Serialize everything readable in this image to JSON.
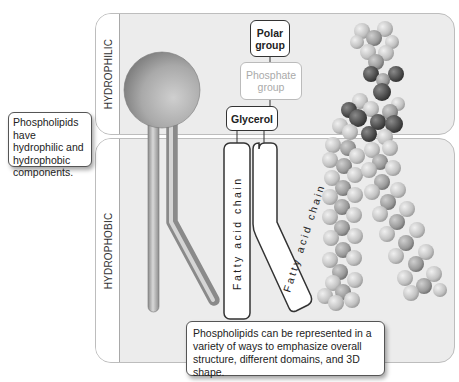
{
  "regions": {
    "hydrophilic_label": "HYDROPHILIC",
    "hydrophobic_label": "HYDROPHOBIC"
  },
  "callouts": {
    "left": "Phospholipids have hydrophilic and hydrophobic components.",
    "bottom": "Phospholipids can be represented in a variety of ways to emphasize overall structure, different domains, and 3D shape."
  },
  "schematic": {
    "polar_group": "Polar group",
    "phosphate_group": "Phosphate group",
    "glycerol": "Glycerol",
    "fatty_acid_chain_1": "Fatty acid chain",
    "fatty_acid_chain_2": "Fatty acid chain"
  },
  "models": {
    "ball_and_stick": "simplified-phospholipid-model",
    "space_filling": "space-filling-3d-model"
  },
  "colors": {
    "panel_bg": "#ececec",
    "panel_border": "#bdbdbd",
    "phosphate_muted": "#aaaaaa",
    "atom_dark": "#4a4a4a",
    "atom_light": "#c8c8c8"
  }
}
